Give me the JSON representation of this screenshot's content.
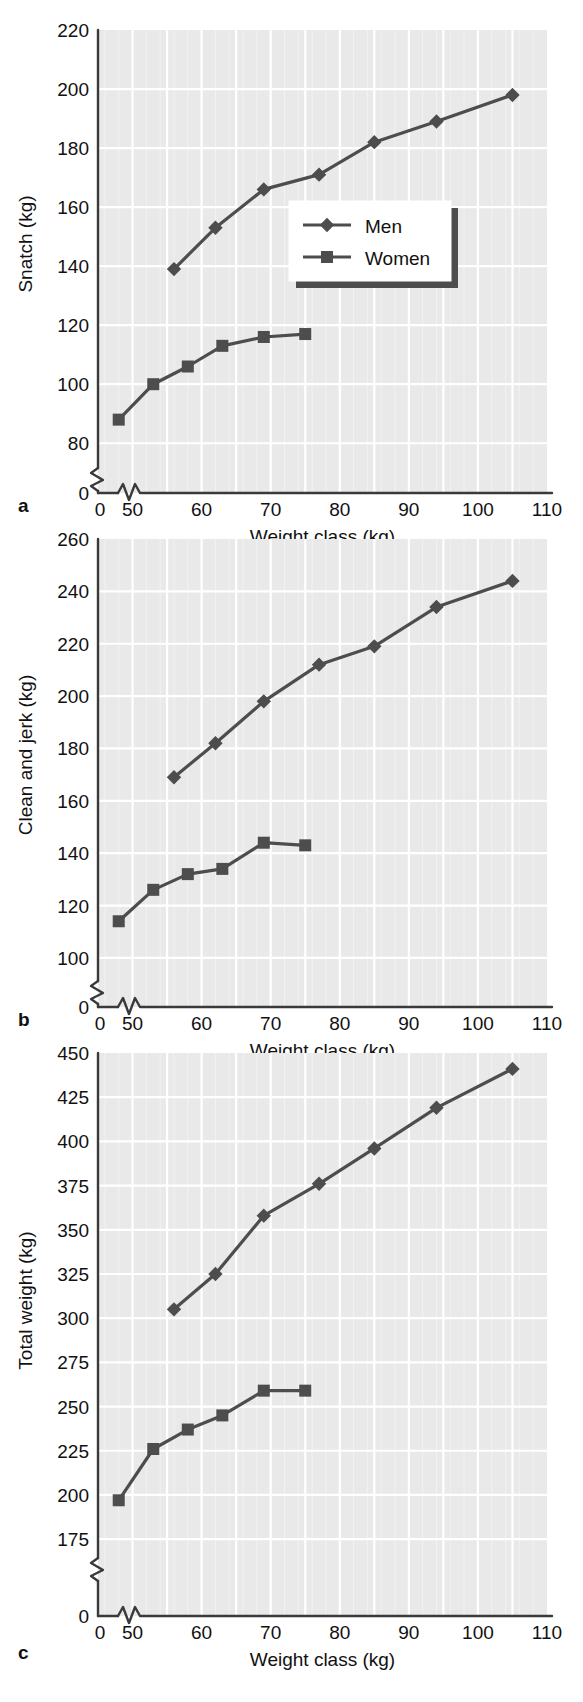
{
  "figure": {
    "panels": [
      "a",
      "b",
      "c"
    ],
    "shared_xlabel": "Weight class (kg)",
    "legend": {
      "entries": [
        "Men",
        "Women"
      ],
      "position": "inside-right-middle (panel a only)"
    },
    "colors": {
      "series": "#4d4d4d",
      "plot_background": "#e9e9e9",
      "grid": "#ffffff",
      "axis": "#3a3a3a",
      "text": "#111111"
    }
  },
  "chart_data": [
    {
      "type": "line",
      "panel": "a",
      "title": "",
      "xlabel": "Weight class (kg)",
      "ylabel": "Snatch (kg)",
      "xlim": [
        45,
        110
      ],
      "ylim": [
        75,
        220
      ],
      "xticks": [
        0,
        50,
        60,
        70,
        80,
        90,
        100,
        110
      ],
      "yticks": [
        0,
        80,
        100,
        120,
        140,
        160,
        180,
        200,
        220
      ],
      "axis_break_x": true,
      "axis_break_y": true,
      "grid": true,
      "legend": [
        "Men",
        "Women"
      ],
      "series": [
        {
          "name": "Men",
          "marker": "diamond",
          "x": [
            56,
            62,
            69,
            77,
            85,
            94,
            105
          ],
          "values": [
            139,
            153,
            166,
            171,
            182,
            189,
            198
          ]
        },
        {
          "name": "Women",
          "marker": "square",
          "x": [
            48,
            53,
            58,
            63,
            69,
            75
          ],
          "values": [
            88,
            100,
            106,
            113,
            116,
            117
          ]
        }
      ]
    },
    {
      "type": "line",
      "panel": "b",
      "title": "",
      "xlabel": "Weight class (kg)",
      "ylabel": "Clean and jerk (kg)",
      "xlim": [
        45,
        110
      ],
      "ylim": [
        95,
        260
      ],
      "xticks": [
        0,
        50,
        60,
        70,
        80,
        90,
        100,
        110
      ],
      "yticks": [
        0,
        100,
        120,
        140,
        160,
        180,
        200,
        220,
        240,
        260
      ],
      "axis_break_x": true,
      "axis_break_y": true,
      "grid": true,
      "legend": [
        "Men",
        "Women"
      ],
      "series": [
        {
          "name": "Men",
          "marker": "diamond",
          "x": [
            56,
            62,
            69,
            77,
            85,
            94,
            105
          ],
          "values": [
            169,
            182,
            198,
            212,
            219,
            234,
            244
          ]
        },
        {
          "name": "Women",
          "marker": "square",
          "x": [
            48,
            53,
            58,
            63,
            69,
            75
          ],
          "values": [
            114,
            126,
            132,
            134,
            144,
            143
          ]
        }
      ]
    },
    {
      "type": "line",
      "panel": "c",
      "title": "",
      "xlabel": "Weight class (kg)",
      "ylabel": "Total weight (kg)",
      "xlim": [
        45,
        110
      ],
      "ylim": [
        170,
        450
      ],
      "xticks": [
        0,
        50,
        60,
        70,
        80,
        90,
        100,
        110
      ],
      "yticks": [
        0,
        175,
        200,
        225,
        250,
        275,
        300,
        325,
        350,
        375,
        400,
        425,
        450
      ],
      "axis_break_x": true,
      "axis_break_y": true,
      "grid": true,
      "legend": [
        "Men",
        "Women"
      ],
      "series": [
        {
          "name": "Men",
          "marker": "diamond",
          "x": [
            56,
            62,
            69,
            77,
            85,
            94,
            105
          ],
          "values": [
            305,
            325,
            358,
            376,
            396,
            419,
            441
          ]
        },
        {
          "name": "Women",
          "marker": "square",
          "x": [
            48,
            53,
            58,
            63,
            69,
            75
          ],
          "values": [
            197,
            226,
            237,
            245,
            259,
            259
          ]
        }
      ]
    }
  ]
}
